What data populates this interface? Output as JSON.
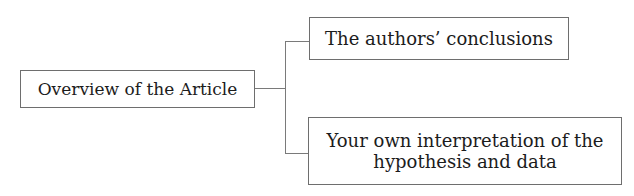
{
  "diagram": {
    "type": "tree",
    "root": {
      "label": "Overview of the Article"
    },
    "children": [
      {
        "label": "The authors’ conclusions"
      },
      {
        "label": "Your own interpretation of the hypothesis and data",
        "lines": [
          "Your own interpretation of the",
          "hypothesis and data"
        ]
      }
    ],
    "colors": {
      "border": "#6e6e6e",
      "connector": "#7a7a7a",
      "text": "#1c1c1c",
      "background": "#ffffff"
    }
  }
}
